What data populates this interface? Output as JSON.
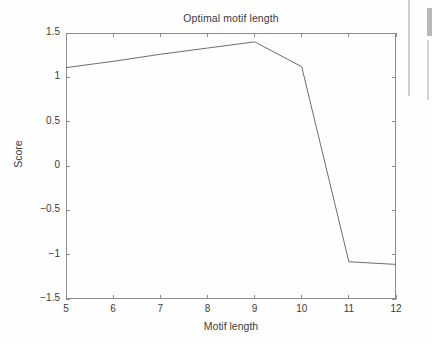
{
  "chart_data": {
    "type": "line",
    "title": "Optimal motif length",
    "xlabel": "Motif length",
    "ylabel": "Score",
    "x": [
      5,
      6,
      7,
      8,
      9,
      10,
      11,
      12
    ],
    "values": [
      1.11,
      1.18,
      1.26,
      1.33,
      1.4,
      1.12,
      -1.08,
      -1.11
    ],
    "series": [
      {
        "name": "Score",
        "values": [
          1.11,
          1.18,
          1.26,
          1.33,
          1.4,
          1.12,
          -1.08,
          -1.11
        ]
      }
    ],
    "xlim": [
      5,
      12
    ],
    "ylim": [
      -1.5,
      1.5
    ],
    "xticks": [
      5,
      6,
      7,
      8,
      9,
      10,
      11,
      12
    ],
    "xtick_labels": [
      "5",
      "6",
      "7",
      "8",
      "9",
      "10",
      "11",
      "12"
    ],
    "yticks": [
      -1.5,
      -1,
      -0.5,
      0,
      0.5,
      1,
      1.5
    ],
    "ytick_labels": [
      "-1.5",
      "-1",
      "-0.5",
      "0",
      "0.5",
      "1",
      "1.5"
    ],
    "grid": false,
    "legend": null,
    "legend_position": "none",
    "line_color": "#6e6e6e",
    "axis_color": "#8c8c8c",
    "background_color": "#fefefe",
    "text_color": "#3c3c3c"
  }
}
